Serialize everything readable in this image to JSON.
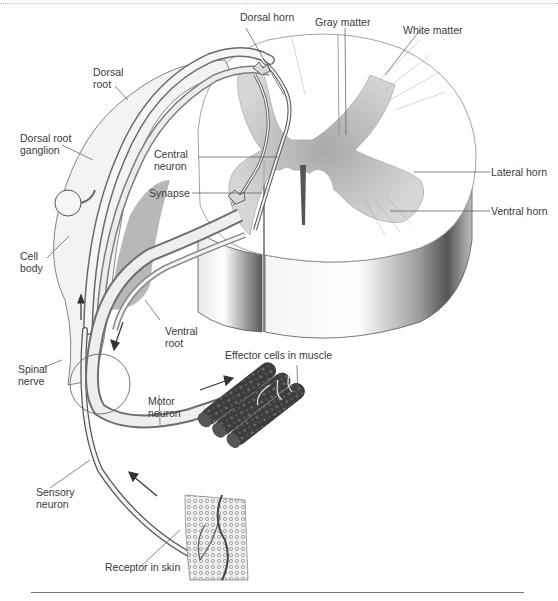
{
  "figure": {
    "title_region": "Reflex arc — spinal cord cross-section with sensory and motor pathways",
    "labels": {
      "dorsal_horn": "Dorsal horn",
      "gray_matter": "Gray matter",
      "white_matter": "White matter",
      "dorsal_root": "Dorsal\nroot",
      "dorsal_root_ganglion": "Dorsal root\nganglion",
      "central_neuron": "Central\nneuron",
      "synapse": "Synapse",
      "lateral_horn": "Lateral horn",
      "ventral_horn": "Ventral horn",
      "cell_body": "Cell\nbody",
      "ventral_root": "Ventral\nroot",
      "effector_cells": "Effector cells in muscle",
      "spinal_nerve": "Spinal\nnerve",
      "motor_neuron": "Motor\nneuron",
      "sensory_neuron": "Sensory\nneuron",
      "receptor_in_skin": "Receptor in skin"
    },
    "colors": {
      "ink": "#3a3a3a",
      "gray_matter": "#b9b9b9",
      "shadow": "#6e6e6e",
      "muscle": "#4a4a4a"
    }
  }
}
